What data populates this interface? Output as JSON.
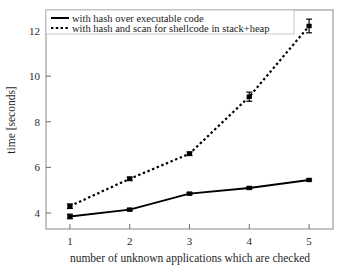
{
  "chart_data": {
    "type": "line",
    "title": "",
    "xlabel": "number of unknown applications which are checked",
    "ylabel": "time [seconds]",
    "x": [
      1,
      2,
      3,
      4,
      5
    ],
    "xticks": [
      "1",
      "2",
      "3",
      "4",
      "5"
    ],
    "yticks": [
      "4",
      "6",
      "8",
      "10",
      "12"
    ],
    "xlim": [
      0.6,
      5.4
    ],
    "ylim": [
      3.3,
      12.9
    ],
    "grid": false,
    "legend_position": "top-left",
    "series": [
      {
        "name": "with hash over executable code",
        "style": "solid",
        "marker": "square",
        "color": "#000000",
        "values": [
          3.85,
          4.15,
          4.85,
          5.1,
          5.45
        ],
        "errors": [
          0.1,
          0.05,
          0.05,
          0.05,
          0.05
        ]
      },
      {
        "name": "with hash and scan for shellcode in stack+heap",
        "style": "dotted",
        "marker": "square",
        "color": "#000000",
        "values": [
          4.3,
          5.5,
          6.6,
          9.1,
          12.2
        ],
        "errors": [
          0.1,
          0.08,
          0.08,
          0.2,
          0.3
        ]
      }
    ]
  },
  "legend": {
    "entries": [
      {
        "label": "with hash over executable code"
      },
      {
        "label": "with hash and scan for shellcode in stack+heap"
      }
    ]
  }
}
